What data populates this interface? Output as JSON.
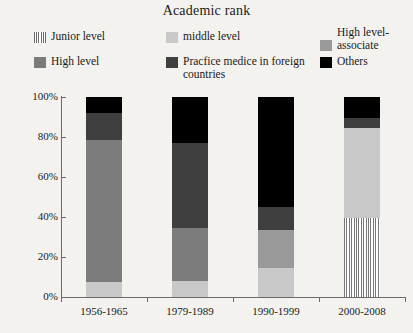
{
  "chart_data": {
    "type": "bar",
    "title": "Academic rank",
    "xlabel": "",
    "ylabel": "",
    "ylim": [
      0,
      100
    ],
    "ytick_labels": [
      "0%",
      "20%",
      "40%",
      "60%",
      "80%",
      "100%"
    ],
    "ytick_values": [
      0,
      20,
      40,
      60,
      80,
      100
    ],
    "grid": false,
    "legend_position": "top",
    "stacked": true,
    "categories": [
      "1956-1965",
      "1979-1989",
      "1990-1999",
      "2000-2008"
    ],
    "series": [
      {
        "name": "Junior level",
        "color": "#efefef",
        "pattern": "vertical-hatch",
        "values": [
          0,
          0,
          0,
          39.5
        ]
      },
      {
        "name": "middle level",
        "color": "#c8c8c8",
        "values": [
          7.5,
          8,
          14.5,
          45
        ]
      },
      {
        "name": "High level-associate",
        "color": "#9a9a9a",
        "values": [
          0,
          0,
          19,
          0
        ]
      },
      {
        "name": "High level",
        "color": "#7c7c7c",
        "values": [
          71,
          26.5,
          0,
          0
        ]
      },
      {
        "name": "Pracfice medice in foreign countries",
        "color": "#3f3f3f",
        "values": [
          13.5,
          42.5,
          11.5,
          5
        ]
      },
      {
        "name": "Others",
        "color": "#000000",
        "values": [
          8,
          23,
          55,
          10.5
        ]
      }
    ]
  },
  "legend": {
    "junior": "Junior level",
    "middle": "middle level",
    "associate": "High level-associate",
    "high": "High level",
    "practice": "Pracfice medice in foreign countries",
    "others": "Others"
  }
}
